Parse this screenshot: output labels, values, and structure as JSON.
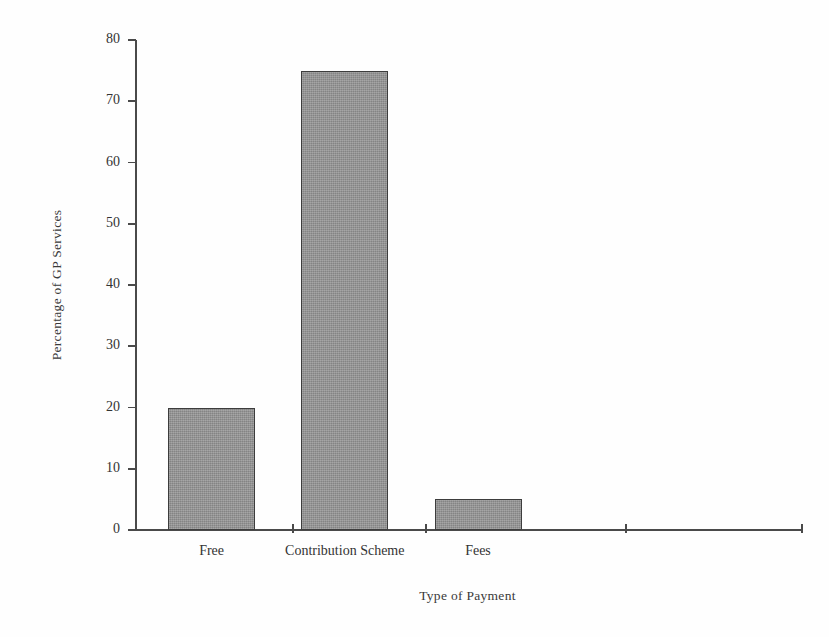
{
  "chart_data": {
    "type": "bar",
    "title": "",
    "subtitle": "",
    "categories": [
      "Free",
      "Contribution Scheme",
      "Fees"
    ],
    "values": [
      20,
      75,
      5
    ],
    "xlabel": "Type of Payment",
    "ylabel": "Percentage of GP Services",
    "ylim": [
      0,
      80
    ],
    "ytick_labels": [
      "0",
      "10",
      "20",
      "30",
      "40",
      "50",
      "60",
      "70",
      "80"
    ],
    "ytick_values": [
      0,
      10,
      20,
      30,
      40,
      50,
      60,
      70,
      80
    ],
    "grid": false,
    "legend": null,
    "annotations": [],
    "bar_fill_color": "#949494",
    "bar_edge_color": "#3d3d3d",
    "axis_color": "#4a4a4a",
    "background_color": "#fefefe",
    "text_color": "#333333"
  }
}
